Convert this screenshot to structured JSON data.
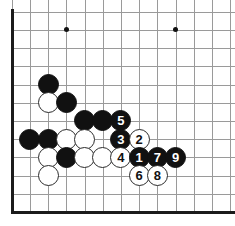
{
  "figure": {
    "kind": "go-board-diagram",
    "width": 235,
    "height": 226,
    "background_color": "#ffffff",
    "grid_line_color": "#9a9a9a",
    "board_edge_color": "#1b1b1b",
    "black_stone_color": "#111111",
    "white_stone_color": "#ffffff",
    "black_label_color": "#ffffff",
    "white_label_color": "#111111"
  },
  "board": {
    "origin_x": 11.7,
    "origin_y": 11.7,
    "spacing": 18.2,
    "columns": 13,
    "rows": 12,
    "edges": [
      {
        "name": "left-edge",
        "orientation": "v"
      },
      {
        "name": "bottom-edge",
        "orientation": "h"
      }
    ],
    "star_points": [
      {
        "col": 3,
        "row": 1
      },
      {
        "col": 9,
        "row": 1
      }
    ]
  },
  "stones": [
    {
      "name": "black-stone",
      "color": "black",
      "col": 2,
      "row": 4,
      "label": ""
    },
    {
      "name": "white-stone",
      "color": "white",
      "col": 2,
      "row": 5,
      "label": ""
    },
    {
      "name": "black-stone",
      "color": "black",
      "col": 3,
      "row": 5,
      "label": ""
    },
    {
      "name": "black-stone",
      "color": "black",
      "col": 4,
      "row": 6,
      "label": ""
    },
    {
      "name": "black-stone",
      "color": "black",
      "col": 5,
      "row": 6,
      "label": ""
    },
    {
      "name": "black-move-5",
      "color": "black",
      "col": 6,
      "row": 6,
      "label": "5"
    },
    {
      "name": "black-stone",
      "color": "black",
      "col": 1,
      "row": 7,
      "label": ""
    },
    {
      "name": "black-stone",
      "color": "black",
      "col": 2,
      "row": 7,
      "label": ""
    },
    {
      "name": "white-stone",
      "color": "white",
      "col": 3,
      "row": 7,
      "label": ""
    },
    {
      "name": "white-stone",
      "color": "white",
      "col": 4,
      "row": 7,
      "label": ""
    },
    {
      "name": "black-move-3",
      "color": "black",
      "col": 6,
      "row": 7,
      "label": "3"
    },
    {
      "name": "white-move-2",
      "color": "white",
      "col": 7,
      "row": 7,
      "label": "2"
    },
    {
      "name": "white-stone",
      "color": "white",
      "col": 2,
      "row": 8,
      "label": ""
    },
    {
      "name": "black-stone",
      "color": "black",
      "col": 3,
      "row": 8,
      "label": ""
    },
    {
      "name": "white-stone",
      "color": "white",
      "col": 4,
      "row": 8,
      "label": ""
    },
    {
      "name": "white-stone",
      "color": "white",
      "col": 5,
      "row": 8,
      "label": ""
    },
    {
      "name": "white-move-4",
      "color": "white",
      "col": 6,
      "row": 8,
      "label": "4"
    },
    {
      "name": "black-move-1",
      "color": "black",
      "col": 7,
      "row": 8,
      "label": "1"
    },
    {
      "name": "black-move-7",
      "color": "black",
      "col": 8,
      "row": 8,
      "label": "7"
    },
    {
      "name": "black-move-9",
      "color": "black",
      "col": 9,
      "row": 8,
      "label": "9"
    },
    {
      "name": "white-stone",
      "color": "white",
      "col": 2,
      "row": 9,
      "label": ""
    },
    {
      "name": "white-move-6",
      "color": "white",
      "col": 7,
      "row": 9,
      "label": "6"
    },
    {
      "name": "white-move-8",
      "color": "white",
      "col": 8,
      "row": 9,
      "label": "8"
    }
  ]
}
